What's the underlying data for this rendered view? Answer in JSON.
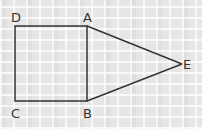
{
  "diagram": {
    "stroke_color": "#333333",
    "points": {
      "A": {
        "label": "A",
        "x": 87,
        "y": 26
      },
      "B": {
        "label": "B",
        "x": 87,
        "y": 101
      },
      "C": {
        "label": "C",
        "x": 15,
        "y": 101
      },
      "D": {
        "label": "D",
        "x": 15,
        "y": 26
      },
      "E": {
        "label": "E",
        "x": 182,
        "y": 64
      }
    },
    "shapes": [
      {
        "type": "square",
        "vertices": [
          "A",
          "B",
          "C",
          "D"
        ]
      },
      {
        "type": "triangle",
        "vertices": [
          "A",
          "B",
          "E"
        ]
      }
    ]
  }
}
